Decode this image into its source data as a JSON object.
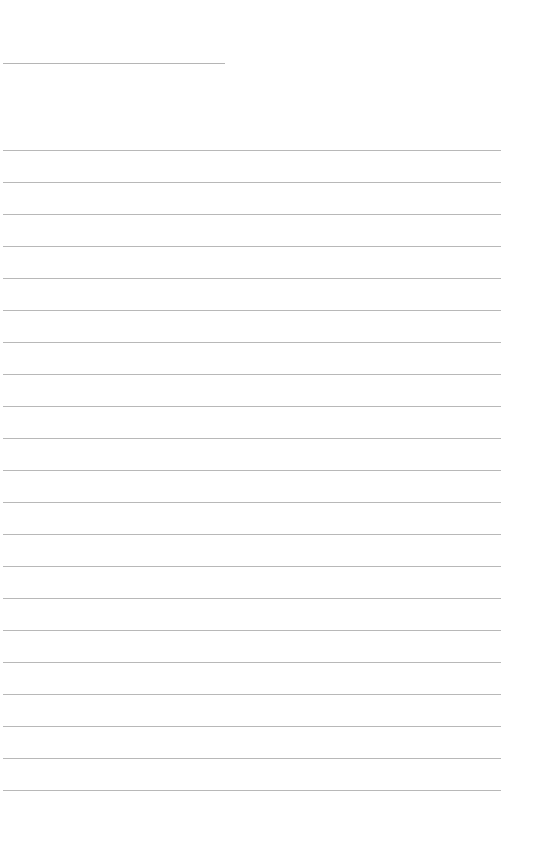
{
  "page": {
    "type": "lined-paper",
    "header_line": {
      "top": 63,
      "left": 3,
      "width": 222
    },
    "rules": {
      "count": 21,
      "first_top": 150,
      "spacing": 32,
      "left": 3,
      "width": 498
    },
    "line_color": "#b8b8b8",
    "background": "#ffffff"
  }
}
